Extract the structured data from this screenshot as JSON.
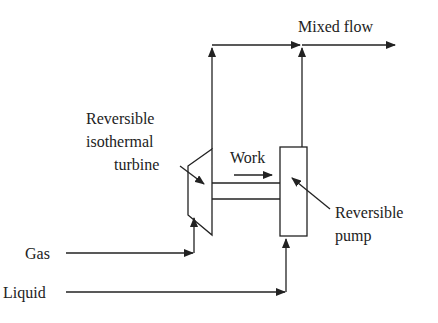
{
  "diagram": {
    "labels": {
      "mixed_flow": "Mixed flow",
      "turbine_line1": "Reversible",
      "turbine_line2": "isothermal",
      "turbine_line3": "turbine",
      "work": "Work",
      "pump_line1": "Reversible",
      "pump_line2": "pump",
      "gas": "Gas",
      "liquid": "Liquid"
    },
    "colors": {
      "stroke": "#222222",
      "background": "#ffffff"
    }
  }
}
